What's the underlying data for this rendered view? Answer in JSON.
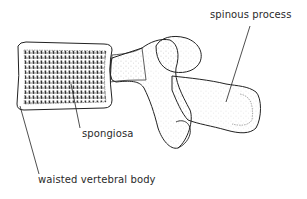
{
  "figure": {
    "labels": {
      "spinous_process": "spinous process",
      "spongiosa": "spongiosa",
      "vertebral_body": "waisted vertebral body"
    }
  }
}
